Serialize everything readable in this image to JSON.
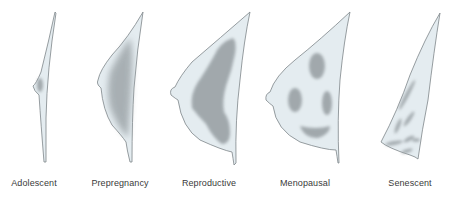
{
  "diagram": {
    "colors": {
      "fill": "#e4ecf0",
      "outline": "#7d8589",
      "gland": "#9aa1a5",
      "label": "#3a3a3a",
      "background": "#ffffff"
    },
    "stages": [
      {
        "id": "adolescent",
        "label": "Adolescent",
        "x": 34
      },
      {
        "id": "prepregnancy",
        "label": "Prepregnancy",
        "x": 120
      },
      {
        "id": "reproductive",
        "label": "Reproductive",
        "x": 209
      },
      {
        "id": "menopausal",
        "label": "Menopausal",
        "x": 305
      },
      {
        "id": "senescent",
        "label": "Senescent",
        "x": 410
      }
    ]
  }
}
